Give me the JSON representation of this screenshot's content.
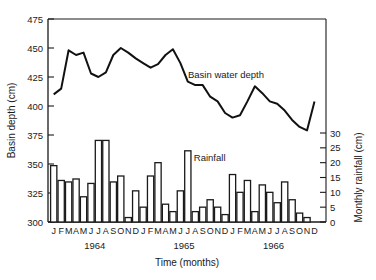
{
  "chart_data": {
    "type": "line+bar",
    "title": "",
    "xlabel": "Time (months)",
    "ylabel_left": "Basin depth (cm)",
    "ylabel_right": "Monthly rainfall (cm)",
    "ylim_left": [
      300,
      475
    ],
    "ylim_right": [
      0,
      30
    ],
    "left_ticks": [
      300,
      325,
      350,
      375,
      400,
      425,
      450,
      475
    ],
    "right_ticks": [
      0,
      5,
      10,
      15,
      20,
      25,
      30
    ],
    "years": [
      "1964",
      "1965",
      "1966"
    ],
    "month_labels": [
      "J",
      "F",
      "M",
      "A",
      "M",
      "J",
      "J",
      "A",
      "S",
      "O",
      "N",
      "D"
    ],
    "grid": false,
    "series": [
      {
        "name": "Basin water depth",
        "type": "line",
        "axis": "left",
        "values": [
          410,
          415,
          448,
          444,
          446,
          428,
          425,
          429,
          444,
          450,
          446,
          441,
          437,
          433,
          436,
          444,
          449,
          437,
          421,
          418,
          418,
          408,
          404,
          394,
          390,
          392,
          404,
          417,
          411,
          404,
          402,
          396,
          388,
          382,
          379,
          404
        ]
      },
      {
        "name": "Rainfall",
        "type": "bar",
        "axis": "right",
        "values": [
          19,
          14,
          13.5,
          14.5,
          8.5,
          13,
          27.5,
          27.5,
          13.5,
          15.5,
          1.5,
          10.5,
          5,
          15.5,
          20,
          6,
          3.5,
          10.5,
          24,
          3.5,
          5,
          7.5,
          5,
          2.5,
          16,
          10,
          14,
          3.5,
          12.5,
          10,
          6.5,
          13.5,
          7.5,
          3,
          1.5,
          0
        ]
      }
    ],
    "annotations": [
      {
        "text": "Basin water depth",
        "near_month_index": 17
      },
      {
        "text": "Rainfall",
        "near_month_index": 18
      }
    ]
  }
}
